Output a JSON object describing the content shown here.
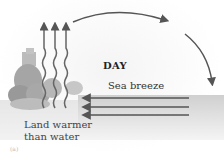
{
  "diagram": {
    "title": "DAY",
    "flow_label": "Sea breeze",
    "land_label_line1": "Land warmer",
    "land_label_line2": "than water",
    "panel_label": "(a)",
    "elements": {
      "rising_heat_arrows": 3,
      "sea_breeze_arrows": 3,
      "circulation_arrows": 2
    },
    "colors": {
      "arrow": "#5a5a5a",
      "water": "#d4d4d4",
      "text": "#2a2a2a",
      "vegetation": "#9a9a9a"
    }
  }
}
